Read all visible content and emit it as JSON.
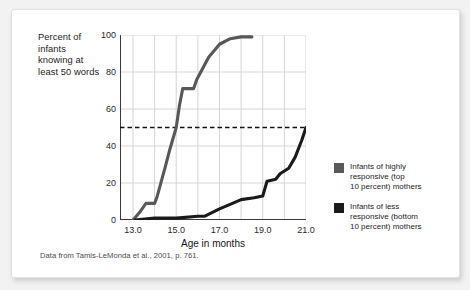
{
  "figure": {
    "caption": "Data from Tamis-LeMonda et al., 2001, p. 761.",
    "card_background": "#ffffff",
    "page_background": "#f2f2f2"
  },
  "legend": {
    "position": "right",
    "entries": [
      {
        "swatch_color": "#585858",
        "line1": "Infants of highly",
        "line2": "responsive (top",
        "line3": "10 percent) mothers"
      },
      {
        "swatch_color": "#1a1a1a",
        "line1": "Infants of less",
        "line2": "responsive (bottom",
        "line3": "10 percent) mothers"
      }
    ]
  },
  "chart_data": {
    "type": "line",
    "title": "",
    "ylabel_lines": [
      "Percent of",
      "infants",
      "knowing at",
      "least 50 words"
    ],
    "ylabel": "Percent of infants knowing at least 50 words",
    "xlabel": "Age in months",
    "xlim": [
      12.4,
      21.0
    ],
    "ylim": [
      0,
      100
    ],
    "xticks": [
      13.0,
      15.0,
      17.0,
      19.0,
      21.0
    ],
    "xtick_labels": [
      "13.0",
      "15.0",
      "17.0",
      "19.0",
      "21.0"
    ],
    "yticks": [
      0,
      20,
      40,
      60,
      80,
      100
    ],
    "ytick_labels": [
      "0",
      "20",
      "40",
      "60",
      "80",
      "100"
    ],
    "grid": true,
    "gridlines_x": [
      13,
      14,
      15,
      16,
      17,
      18,
      19,
      20,
      21
    ],
    "gridlines_y": [
      20,
      40,
      60,
      80,
      100
    ],
    "grid_color": "#d5d5d5",
    "reference_line": {
      "y": 50,
      "style": "dashed",
      "color": "#111111",
      "label": "50 percent"
    },
    "series": [
      {
        "name": "Infants of highly responsive (top 10 percent) mothers",
        "color": "#585858",
        "points": [
          [
            13.0,
            0
          ],
          [
            13.3,
            4
          ],
          [
            13.6,
            9
          ],
          [
            14.0,
            9
          ],
          [
            14.1,
            12
          ],
          [
            14.5,
            29
          ],
          [
            14.7,
            38
          ],
          [
            15.0,
            50
          ],
          [
            15.15,
            62
          ],
          [
            15.3,
            71
          ],
          [
            15.8,
            71
          ],
          [
            15.95,
            76
          ],
          [
            16.5,
            88
          ],
          [
            17.0,
            95
          ],
          [
            17.5,
            98
          ],
          [
            18.0,
            99
          ],
          [
            18.5,
            99
          ]
        ]
      },
      {
        "name": "Infants of less responsive (bottom 10 percent) mothers",
        "color": "#1a1a1a",
        "points": [
          [
            13.1,
            0
          ],
          [
            14.0,
            1
          ],
          [
            15.0,
            1
          ],
          [
            16.0,
            2
          ],
          [
            16.3,
            2
          ],
          [
            17.0,
            6
          ],
          [
            17.6,
            9
          ],
          [
            18.0,
            11
          ],
          [
            18.6,
            12
          ],
          [
            19.0,
            13
          ],
          [
            19.2,
            21
          ],
          [
            19.6,
            22
          ],
          [
            19.8,
            25
          ],
          [
            20.2,
            28
          ],
          [
            20.5,
            34
          ],
          [
            20.8,
            43
          ],
          [
            21.0,
            50
          ]
        ]
      }
    ]
  }
}
